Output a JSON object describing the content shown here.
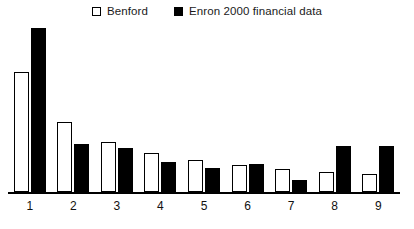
{
  "chart_data": {
    "type": "bar",
    "title": "",
    "subtitle": "",
    "xlabel": "",
    "ylabel": "",
    "categories": [
      "1",
      "2",
      "3",
      "4",
      "5",
      "6",
      "7",
      "8",
      "9"
    ],
    "series": [
      {
        "name": "Benford",
        "swatch": "hollow",
        "color": "#ffffff",
        "edge_color": "#000000",
        "values": [
          30.1,
          17.6,
          12.5,
          9.7,
          7.9,
          6.7,
          5.8,
          5.1,
          4.6
        ]
      },
      {
        "name": "Enron 2000 financial data",
        "swatch": "filled",
        "color": "#000000",
        "edge_color": "#000000",
        "values": [
          41.0,
          12.0,
          11.0,
          7.5,
          6.0,
          7.0,
          3.0,
          11.5,
          11.5
        ]
      }
    ],
    "ylim": [
      0,
      41.0
    ],
    "grid": false,
    "y_axis_visible": false,
    "x_axis_visible": true,
    "legend_position": "top-center"
  },
  "legend": {
    "entries": [
      {
        "label": "Benford"
      },
      {
        "label": "Enron 2000 financial data"
      }
    ]
  }
}
